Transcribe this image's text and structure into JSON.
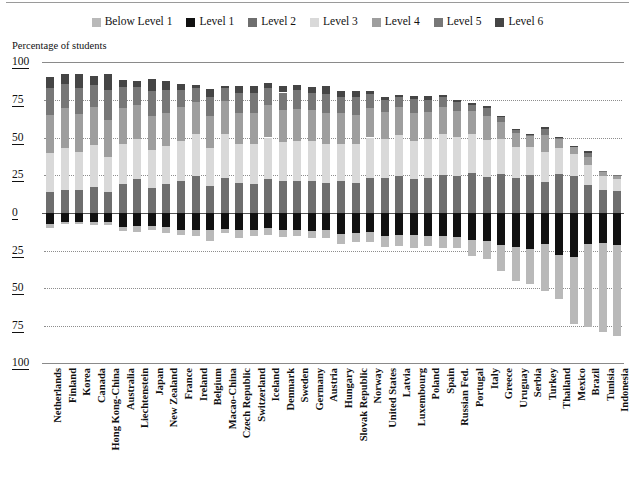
{
  "axis_title": "Percentage of students",
  "legend": {
    "items": [
      {
        "label": "Below Level 1",
        "color": "#b9b9b9"
      },
      {
        "label": "Level 1",
        "color": "#111111"
      },
      {
        "label": "Level 2",
        "color": "#6e6e6e"
      },
      {
        "label": "Level 3",
        "color": "#d9d9d9"
      },
      {
        "label": "Level 4",
        "color": "#9e9e9e"
      },
      {
        "label": "Level 5",
        "color": "#777777"
      },
      {
        "label": "Level 6",
        "color": "#454545"
      }
    ]
  },
  "y_ticks_upper": [
    "100",
    "75",
    "50",
    "25",
    "0"
  ],
  "y_ticks_lower": [
    "25",
    "50",
    "75",
    "100"
  ],
  "chart_data": {
    "type": "bar",
    "title": "",
    "subtitle": "",
    "xlabel": "",
    "ylabel": "Percentage of students",
    "ylim": [
      -100,
      100
    ],
    "grid": true,
    "legend_position": "top-center",
    "stacked": true,
    "diverging": true,
    "note": "Stacked diverging bars: Levels 2-6 plotted upward from zero, Level 1 and Below Level 1 plotted downward.",
    "categories": [
      "Netherlands",
      "Finland",
      "Korea",
      "Canada",
      "Hong Kong-China",
      "Australia",
      "Liechtenstein",
      "Japan",
      "New Zealand",
      "France",
      "Ireland",
      "Belgium",
      "Macao-China",
      "Czech Republic",
      "Switzerland",
      "Iceland",
      "Denmark",
      "Sweden",
      "Germany",
      "Austria",
      "Hungary",
      "Slovak Republic",
      "Norway",
      "United States",
      "Latvia",
      "Luxembourg",
      "Poland",
      "Spain",
      "Russian Fed.",
      "Portugal",
      "Italy",
      "Greece",
      "Uruguay",
      "Serbia",
      "Turkey",
      "Thailand",
      "Mexico",
      "Brazil",
      "Tunisia",
      "Indonesia"
    ],
    "series": [
      {
        "name": "Level 6",
        "color": "#454545",
        "direction": "up",
        "values": [
          7.0,
          6.7,
          9.2,
          6.2,
          10.5,
          4.3,
          4.2,
          8.2,
          5.7,
          3.5,
          2.2,
          5.5,
          1.6,
          5.0,
          4.5,
          2.9,
          4.4,
          3.5,
          4.1,
          5.2,
          3.6,
          3.5,
          2.0,
          2.0,
          1.0,
          2.1,
          2.3,
          1.4,
          1.6,
          0.9,
          1.5,
          0.6,
          0.8,
          0.2,
          1.2,
          0.2,
          0.4,
          1.2,
          0.0,
          0.0
        ]
      },
      {
        "name": "Level 5",
        "color": "#777777",
        "direction": "up",
        "values": [
          18.2,
          16.0,
          17.2,
          14.2,
          20.0,
          14.0,
          12.0,
          16.0,
          15.1,
          11.6,
          9.1,
          12.7,
          8.8,
          12.9,
          13.1,
          11.4,
          11.8,
          12.6,
          11.4,
          12.6,
          11.0,
          12.0,
          9.6,
          8.0,
          7.0,
          9.2,
          8.0,
          6.5,
          6.0,
          4.2,
          5.5,
          2.9,
          2.0,
          1.4,
          4.4,
          1.1,
          0.6,
          2.4,
          0.6,
          0.4
        ]
      },
      {
        "name": "Level 4",
        "color": "#9e9e9e",
        "direction": "up",
        "values": [
          25.0,
          26.0,
          25.0,
          25.5,
          24.6,
          24.0,
          22.5,
          23.0,
          22.0,
          22.0,
          21.0,
          21.0,
          22.0,
          21.0,
          21.0,
          21.5,
          21.0,
          21.2,
          20.5,
          20.5,
          20.0,
          19.5,
          19.5,
          18.0,
          18.5,
          18.0,
          18.0,
          18.0,
          17.0,
          15.0,
          15.5,
          11.5,
          9.0,
          7.4,
          11.0,
          5.9,
          4.5,
          5.7,
          3.0,
          2.4
        ]
      },
      {
        "name": "Level 3",
        "color": "#d9d9d9",
        "direction": "up",
        "values": [
          25.8,
          27.8,
          25.0,
          27.5,
          23.0,
          26.0,
          26.5,
          25.0,
          25.5,
          26.5,
          28.0,
          25.0,
          28.5,
          25.5,
          26.0,
          27.5,
          26.0,
          26.0,
          26.0,
          25.5,
          25.0,
          25.5,
          26.5,
          25.5,
          27.0,
          25.5,
          26.0,
          27.0,
          26.0,
          26.0,
          24.5,
          23.0,
          20.5,
          18.5,
          20.0,
          17.0,
          14.5,
          13.0,
          9.5,
          8.0
        ]
      },
      {
        "name": "Level 2",
        "color": "#6e6e6e",
        "direction": "up",
        "values": [
          14.0,
          15.5,
          15.5,
          17.5,
          14.0,
          19.5,
          22.5,
          16.5,
          19.0,
          21.5,
          24.5,
          18.0,
          23.5,
          20.0,
          19.5,
          22.5,
          21.0,
          21.5,
          21.5,
          20.0,
          21.0,
          20.0,
          23.5,
          23.5,
          24.5,
          22.5,
          23.0,
          25.0,
          24.5,
          26.5,
          24.0,
          26.0,
          23.5,
          25.0,
          20.5,
          26.0,
          24.5,
          18.5,
          15.0,
          14.5
        ]
      },
      {
        "name": "Level 1",
        "color": "#111111",
        "direction": "down",
        "values": [
          7.2,
          5.9,
          6.0,
          6.2,
          6.0,
          9.0,
          8.8,
          8.5,
          9.0,
          11.0,
          11.0,
          11.5,
          10.5,
          11.5,
          11.5,
          10.0,
          11.5,
          11.0,
          12.0,
          11.5,
          14.0,
          13.5,
          12.5,
          15.5,
          14.5,
          14.5,
          15.5,
          15.0,
          16.0,
          18.0,
          18.5,
          21.5,
          22.5,
          24.0,
          20.5,
          28.0,
          29.5,
          20.5,
          20.0,
          21.5
        ]
      },
      {
        "name": "Below Level 1",
        "color": "#b9b9b9",
        "direction": "down",
        "values": [
          2.8,
          1.5,
          1.0,
          2.0,
          2.0,
          3.0,
          4.0,
          3.0,
          4.5,
          3.5,
          4.0,
          7.0,
          3.0,
          5.0,
          4.0,
          4.5,
          4.5,
          4.0,
          4.5,
          5.0,
          6.5,
          6.0,
          6.5,
          7.0,
          7.5,
          8.5,
          6.5,
          8.0,
          7.5,
          10.5,
          12.0,
          17.0,
          22.5,
          23.0,
          31.5,
          29.5,
          44.5,
          55.5,
          59.5,
          60.5
        ]
      }
    ]
  }
}
